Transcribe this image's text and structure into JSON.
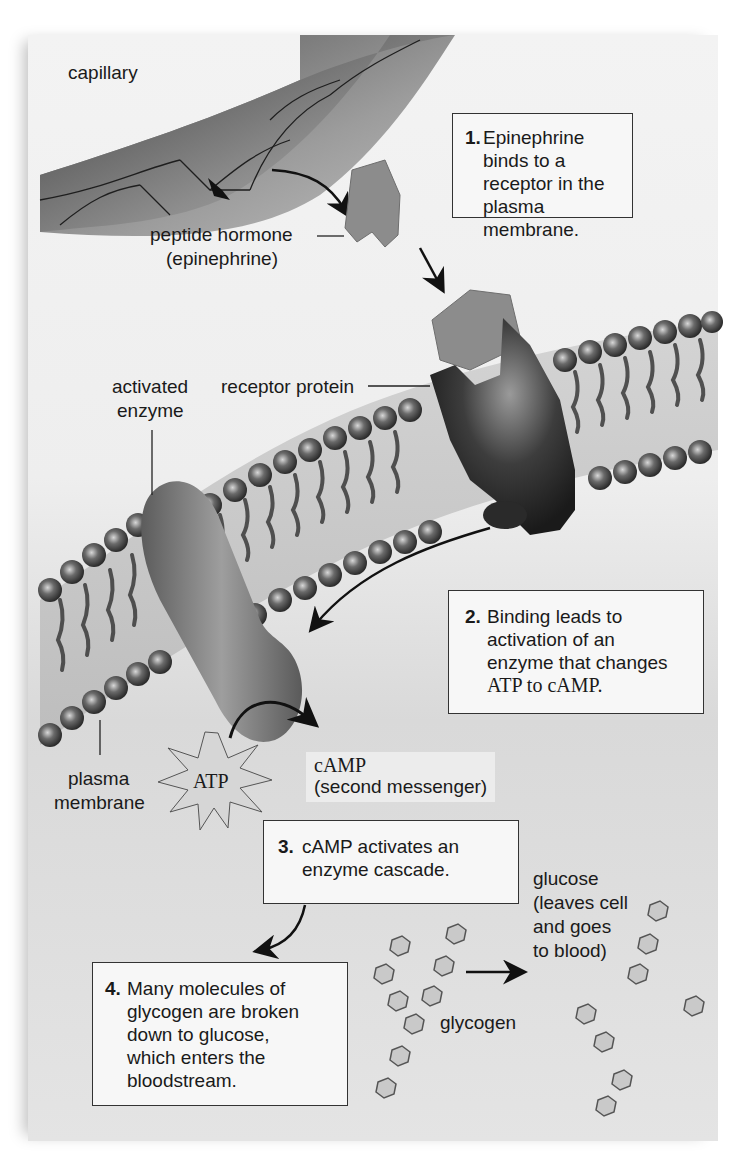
{
  "figure": {
    "labels": {
      "capillary": "capillary",
      "peptide_hormone_line1": "peptide hormone",
      "peptide_hormone_line2": "(epinephrine)",
      "activated_enzyme_line1": "activated",
      "activated_enzyme_line2": "enzyme",
      "receptor_protein": "receptor protein",
      "plasma_membrane_line1": "plasma",
      "plasma_membrane_line2": "membrane",
      "atp": "ATP",
      "camp_line1": "cAMP",
      "camp_line2": "(second messenger)",
      "glucose_line1": "glucose",
      "glucose_line2": "(leaves cell",
      "glucose_line3": "and goes",
      "glucose_line4": "to blood)",
      "glycogen": "glycogen"
    },
    "steps": [
      {
        "number": "1.",
        "lines": [
          "Epinephrine binds to a",
          "receptor in the plasma",
          "membrane."
        ]
      },
      {
        "number": "2.",
        "lines": [
          "Binding leads to",
          "activation of an",
          "enzyme that changes",
          "ATP to cAMP."
        ]
      },
      {
        "number": "3.",
        "lines": [
          "cAMP activates an",
          "enzyme cascade."
        ]
      },
      {
        "number": "4.",
        "lines": [
          "Many molecules of",
          "glycogen are broken",
          "down to glucose,",
          "which enters the",
          "bloodstream."
        ]
      }
    ],
    "colors": {
      "background": "#eeeeee",
      "hormone": "#8a8a8a",
      "receptor": "#2e2e2e",
      "enzyme": "#6f6f6f",
      "lipid_head": "#4a4a4a",
      "box_border": "#333333"
    }
  }
}
